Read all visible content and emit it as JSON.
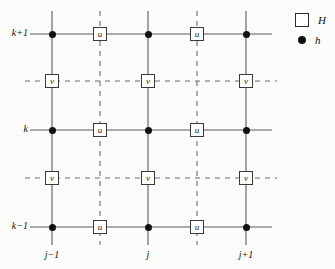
{
  "figure": {
    "background_color": "#fcfcfb",
    "line_color": "#555555",
    "ink_color": "#111111"
  },
  "legend": {
    "items": [
      {
        "symbol": "square",
        "icon_name": "legend-square-icon",
        "label": "H"
      },
      {
        "symbol": "dot",
        "icon_name": "legend-dot-icon",
        "label": "h"
      }
    ]
  },
  "axes": {
    "row_labels": [
      {
        "text": "k+1",
        "y": 34
      },
      {
        "text": "k",
        "y": 130
      },
      {
        "text": "k−1",
        "y": 227
      }
    ],
    "column_labels": [
      {
        "text": "j−1",
        "x": 52
      },
      {
        "text": "j",
        "x": 148
      },
      {
        "text": "j+1",
        "x": 246
      }
    ]
  },
  "grid": {
    "solid_columns_x": [
      52,
      148,
      246
    ],
    "dashed_columns_x": [
      100,
      197
    ],
    "solid_rows_y": [
      34,
      130,
      227
    ],
    "dashed_rows_y": [
      81,
      178
    ],
    "h_nodes": [
      {
        "label": "h",
        "x": 52,
        "y": 34
      },
      {
        "label": "h",
        "x": 148,
        "y": 34
      },
      {
        "label": "h",
        "x": 246,
        "y": 34
      },
      {
        "label": "h",
        "x": 52,
        "y": 130
      },
      {
        "label": "h",
        "x": 148,
        "y": 130
      },
      {
        "label": "h",
        "x": 246,
        "y": 130
      },
      {
        "label": "h",
        "x": 52,
        "y": 227
      },
      {
        "label": "h",
        "x": 148,
        "y": 227
      },
      {
        "label": "h",
        "x": 246,
        "y": 227
      }
    ],
    "u_nodes": [
      {
        "label": "u",
        "x": 100,
        "y": 34
      },
      {
        "label": "u",
        "x": 197,
        "y": 34
      },
      {
        "label": "u",
        "x": 100,
        "y": 130
      },
      {
        "label": "u",
        "x": 197,
        "y": 130
      },
      {
        "label": "u",
        "x": 100,
        "y": 227
      },
      {
        "label": "u",
        "x": 197,
        "y": 227
      }
    ],
    "v_nodes": [
      {
        "label": "v",
        "x": 52,
        "y": 81
      },
      {
        "label": "v",
        "x": 148,
        "y": 81
      },
      {
        "label": "v",
        "x": 246,
        "y": 81
      },
      {
        "label": "v",
        "x": 52,
        "y": 178
      },
      {
        "label": "v",
        "x": 148,
        "y": 178
      },
      {
        "label": "v",
        "x": 246,
        "y": 178
      }
    ]
  }
}
